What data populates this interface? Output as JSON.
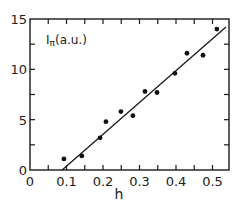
{
  "chart_data": {
    "type": "scatter",
    "title": "",
    "xlabel": "h",
    "ylabel": "Iπ(a.u.)",
    "ylabel_main": "I",
    "ylabel_sub": "π",
    "ylabel_unit": "(a.u.)",
    "xlim": [
      0,
      0.55
    ],
    "ylim": [
      0,
      15
    ],
    "xticks": [
      0,
      0.1,
      0.2,
      0.3,
      0.4,
      0.5
    ],
    "xtick_labels": [
      "0",
      "0.1",
      "0.2",
      "0.3",
      "0.4",
      "0.5"
    ],
    "xminor_step": 0.05,
    "yticks": [
      0,
      5,
      10,
      15
    ],
    "ytick_labels": [
      "0",
      "5",
      "10",
      "15"
    ],
    "yminor_step": 2.5,
    "grid": false,
    "legend": null,
    "series": [
      {
        "name": "measured",
        "marker": "filled-circle",
        "x": [
          0.093,
          0.142,
          0.192,
          0.208,
          0.249,
          0.282,
          0.315,
          0.348,
          0.397,
          0.43,
          0.474,
          0.512
        ],
        "y": [
          1.1,
          1.4,
          3.2,
          4.8,
          5.8,
          5.4,
          7.8,
          7.7,
          9.6,
          11.6,
          11.4,
          14.0
        ]
      },
      {
        "name": "linear fit",
        "marker": "line",
        "x": [
          0.088,
          0.537
        ],
        "y": [
          0.0,
          14.2
        ]
      }
    ]
  }
}
